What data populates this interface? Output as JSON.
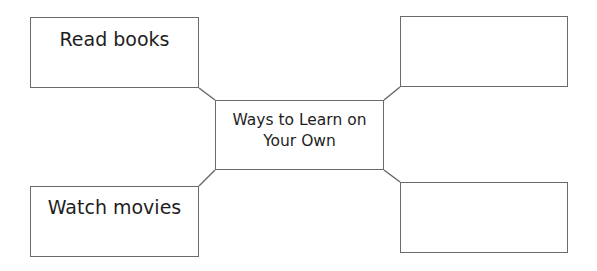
{
  "diagram": {
    "type": "spider-map",
    "center": {
      "line1": "Ways to Learn on",
      "line2": "Your Own"
    },
    "branches": [
      {
        "position": "top-left",
        "text": "Read books"
      },
      {
        "position": "top-right",
        "text": ""
      },
      {
        "position": "bottom-left",
        "text": "Watch movies"
      },
      {
        "position": "bottom-right",
        "text": ""
      }
    ],
    "colors": {
      "border": "#6b6b6b",
      "text": "#1e1e1e",
      "background": "#ffffff"
    }
  }
}
